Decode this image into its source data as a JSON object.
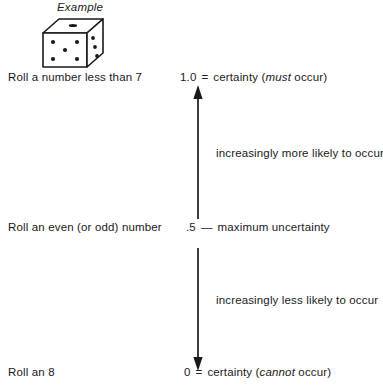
{
  "figure": {
    "heading": "Example",
    "illustration": {
      "name": "six-sided-die",
      "front_face_pips": 5,
      "right_face_pips": 3,
      "top_face_pips": 1
    },
    "rows": [
      {
        "event_label": "Roll a number less than 7",
        "value": "1.0",
        "separator": "=",
        "description_before": "certainty (",
        "description_emphasis": "must",
        "description_after": " occur)"
      },
      {
        "event_label": "Roll an even (or odd) number",
        "value": ".5",
        "separator": "—",
        "description_before": "maximum uncertainty",
        "description_emphasis": "",
        "description_after": ""
      },
      {
        "event_label": "Roll an 8",
        "value": "0",
        "separator": "=",
        "description_before": "certainty (",
        "description_emphasis": "cannot",
        "description_after": " occur)"
      }
    ],
    "segments": [
      {
        "direction": "up",
        "note": "increasingly more likely to occur"
      },
      {
        "direction": "down",
        "note": "increasingly less likely to occur"
      }
    ],
    "colors": {
      "ink": "#1a1a1a",
      "background": "#ffffff"
    }
  }
}
